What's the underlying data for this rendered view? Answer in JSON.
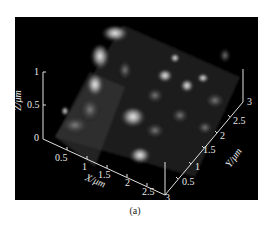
{
  "figure": {
    "caption": "(a)"
  },
  "axes": {
    "z": {
      "title": "Z/μm",
      "ticks": [
        "0",
        "0.5",
        "1"
      ]
    },
    "x": {
      "title": "X/μm",
      "ticks": [
        "0.5",
        "1",
        "1.5",
        "2",
        "2.5",
        "3"
      ]
    },
    "y": {
      "title": "Y/μm",
      "ticks": [
        "0.5",
        "1",
        "1.5",
        "2",
        "2.5",
        "3"
      ]
    }
  }
}
